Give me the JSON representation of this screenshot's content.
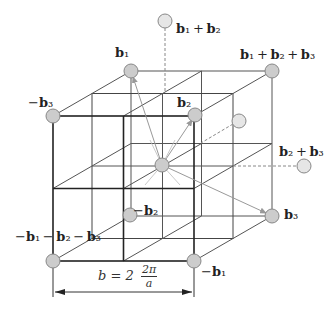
{
  "diagram": {
    "colors": {
      "grid_line": "#333333",
      "thin_line": "#666666",
      "vector": "#999999",
      "dashed": "#888888",
      "node_fill": "#cccccc",
      "node_stroke": "#888888"
    },
    "nodes": [
      {
        "id": "b1",
        "label_parts": [
          "b",
          "1"
        ],
        "x": 131,
        "y": 71
      },
      {
        "id": "b2",
        "label_parts": [
          "b",
          "2"
        ],
        "x": 195,
        "y": 115
      },
      {
        "id": "b3",
        "label_parts": [
          "b",
          "3"
        ],
        "x": 272,
        "y": 216
      },
      {
        "id": "minus_b1",
        "x": 194,
        "y": 261
      },
      {
        "id": "minus_b2",
        "x": 130,
        "y": 215
      },
      {
        "id": "minus_b3",
        "x": 53,
        "y": 116
      },
      {
        "id": "b1_plus_b2",
        "x": 165,
        "y": 21
      },
      {
        "id": "b1_plus_b2_plus_b3",
        "x": 272,
        "y": 71
      },
      {
        "id": "b2_plus_b3",
        "x": 304,
        "y": 166
      },
      {
        "id": "minus_b1_b2_b3",
        "x": 53,
        "y": 261
      },
      {
        "id": "center",
        "x": 162,
        "y": 165
      },
      {
        "id": "side_point",
        "x": 239,
        "y": 121
      }
    ],
    "labels": {
      "b1": "b₁",
      "b2": "b₂",
      "b3": "b₃",
      "minus_b1": "−b₁",
      "minus_b2": "−b₂",
      "minus_b3": "−b₃",
      "b1_plus_b2": "b₁ + b₂",
      "b1_plus_b2_plus_b3": "b₁ + b₂ + b₃",
      "b2_plus_b3": "b₂ + b₃",
      "minus_b1_b2_b3": "−b₁ − b₂ − b₃"
    },
    "dimension": {
      "lhs": "b = 2",
      "numerator": "2π",
      "denominator": "a"
    }
  }
}
